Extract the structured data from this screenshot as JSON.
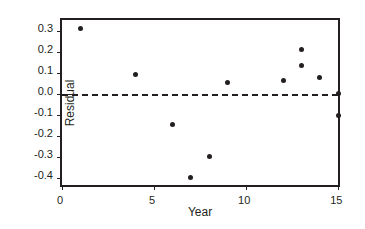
{
  "chart_data": {
    "type": "scatter",
    "title": "",
    "xlabel": "Year",
    "ylabel": "Residual",
    "xlim": [
      0,
      15.2
    ],
    "ylim": [
      -0.45,
      0.35
    ],
    "grid": false,
    "legend": null,
    "xticks": [
      0,
      5,
      10,
      15
    ],
    "xtick_labels": [
      "0",
      "5",
      "10",
      "15"
    ],
    "yticks": [
      0.3,
      0.2,
      0.1,
      0.0,
      -0.1,
      -0.2,
      -0.3,
      -0.4
    ],
    "ytick_labels": [
      "0.3",
      "0.2",
      "0.1",
      "0.0",
      "-0.1",
      "-0.2",
      "-0.3",
      "-0.4"
    ],
    "reference_line": {
      "name": "zero-residual-line",
      "orientation": "horizontal",
      "value": 0.0,
      "style": "dashed",
      "color": "#231f20"
    },
    "marker": {
      "shape": "circle",
      "filled": true,
      "color": "#231f20",
      "size_px": 5
    },
    "x": [
      1,
      4,
      6,
      7,
      8,
      9,
      12,
      13,
      13,
      14,
      15,
      15
    ],
    "y": [
      0.31,
      0.09,
      -0.145,
      -0.395,
      -0.295,
      0.055,
      0.065,
      0.21,
      0.135,
      0.08,
      0.0,
      -0.1
    ],
    "points": [
      {
        "x": 1,
        "y": 0.31
      },
      {
        "x": 4,
        "y": 0.09
      },
      {
        "x": 6,
        "y": -0.145
      },
      {
        "x": 7,
        "y": -0.395
      },
      {
        "x": 8,
        "y": -0.295
      },
      {
        "x": 9,
        "y": 0.055
      },
      {
        "x": 12,
        "y": 0.065
      },
      {
        "x": 13,
        "y": 0.21
      },
      {
        "x": 13,
        "y": 0.135
      },
      {
        "x": 14,
        "y": 0.08
      },
      {
        "x": 15,
        "y": 0.0
      },
      {
        "x": 15,
        "y": -0.1
      }
    ]
  },
  "figure": {
    "background": "#ffffff",
    "frame_color": "#231f20"
  }
}
